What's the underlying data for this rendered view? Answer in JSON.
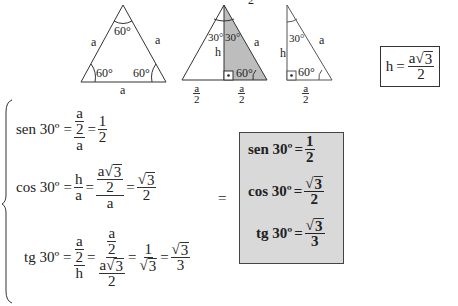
{
  "figures": {
    "equilateral": {
      "angles": [
        "60°",
        "60°",
        "60°"
      ],
      "sides": [
        "a",
        "a",
        "a"
      ]
    },
    "split": {
      "angles": [
        "30°",
        "30°",
        "60°"
      ],
      "side": "a",
      "height": "h",
      "half_base_num": "a",
      "half_base_den": "2",
      "top_fragment": "2",
      "shade_color": "#bdbdbd"
    },
    "right": {
      "angles": [
        "30°",
        "60°"
      ],
      "side": "a",
      "height": "h",
      "half_base_num": "a",
      "half_base_den": "2"
    }
  },
  "h_formula": {
    "lhs": "h",
    "eq": "=",
    "num_coef": "a",
    "num_rad": "3",
    "den": "2"
  },
  "derivations": {
    "sen": {
      "lhs": "sen 30º",
      "eq": "=",
      "f1_num_num": "a",
      "f1_num_den": "2",
      "f1_den": "a",
      "f2_num": "1",
      "f2_den": "2"
    },
    "cos": {
      "lhs": "cos 30º",
      "eq": "=",
      "f1_num": "h",
      "f1_den": "a",
      "f2_num_coef": "a",
      "f2_num_rad": "3",
      "f2_num_den": "2",
      "f2_den": "a",
      "f3_num_rad": "3",
      "f3_den": "2"
    },
    "tg": {
      "lhs": "tg 30º",
      "eq": "=",
      "f1_num_num": "a",
      "f1_num_den": "2",
      "f1_den": "h",
      "f2_num_num": "a",
      "f2_num_den": "2",
      "f2_den_coef": "a",
      "f2_den_rad": "3",
      "f2_den_den": "2",
      "f3_num": "1",
      "f3_den_rad": "3",
      "f4_num_rad": "3",
      "f4_den": "3"
    }
  },
  "middle_equals": "=",
  "summary": {
    "bg_color": "#d9d9d9",
    "sen": {
      "lhs": "sen 30º",
      "eq": "=",
      "num": "1",
      "den": "2"
    },
    "cos": {
      "lhs": "cos 30º",
      "eq": "=",
      "num_rad": "3",
      "den": "2"
    },
    "tg": {
      "lhs": "tg 30º",
      "eq": "=",
      "num_rad": "3",
      "den": "3"
    }
  },
  "radical_symbol": "√"
}
